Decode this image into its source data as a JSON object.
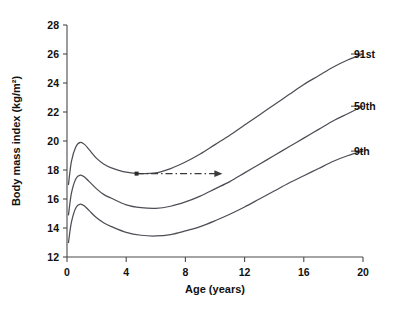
{
  "chart_data": {
    "type": "line",
    "title": "",
    "xlabel": "Age (years)",
    "ylabel": "Body mass index (kg/m²)",
    "xlim": [
      0,
      20
    ],
    "ylim": [
      12,
      28
    ],
    "xticks": [
      0,
      4,
      8,
      12,
      16,
      20
    ],
    "yticks": [
      12,
      14,
      16,
      18,
      20,
      22,
      24,
      26,
      28
    ],
    "xtick_labels": [
      "0",
      "4",
      "8",
      "12",
      "16",
      "20"
    ],
    "ytick_labels": [
      "12",
      "14",
      "16",
      "18",
      "20",
      "22",
      "24",
      "26",
      "28"
    ],
    "grid": false,
    "legend_position": "right-inline-labels",
    "series": [
      {
        "name": "91st",
        "label": "91st",
        "x": [
          0.1,
          0.3,
          0.6,
          0.9,
          1.2,
          1.5,
          2.0,
          2.5,
          3.0,
          4.0,
          5.0,
          6.0,
          7.0,
          8.0,
          9.0,
          10.0,
          11.0,
          12.0,
          13.0,
          14.0,
          15.0,
          16.0,
          17.0,
          18.0,
          19.0,
          20.0
        ],
        "y": [
          17.0,
          18.6,
          19.6,
          19.9,
          19.75,
          19.4,
          18.8,
          18.4,
          18.15,
          17.85,
          17.75,
          17.8,
          18.1,
          18.55,
          19.1,
          19.75,
          20.4,
          21.1,
          21.8,
          22.5,
          23.2,
          23.9,
          24.5,
          25.1,
          25.6,
          26.0
        ]
      },
      {
        "name": "50th",
        "label": "50th",
        "x": [
          0.1,
          0.3,
          0.6,
          0.9,
          1.2,
          1.5,
          2.0,
          2.5,
          3.0,
          4.0,
          5.0,
          6.0,
          7.0,
          8.0,
          9.0,
          10.0,
          11.0,
          12.0,
          13.0,
          14.0,
          15.0,
          16.0,
          17.0,
          18.0,
          19.0,
          20.0
        ],
        "y": [
          14.9,
          16.4,
          17.4,
          17.65,
          17.5,
          17.2,
          16.7,
          16.3,
          16.05,
          15.6,
          15.4,
          15.35,
          15.5,
          15.8,
          16.2,
          16.7,
          17.2,
          17.8,
          18.4,
          19.0,
          19.6,
          20.2,
          20.8,
          21.4,
          21.9,
          22.4
        ]
      },
      {
        "name": "9th",
        "label": "9th",
        "x": [
          0.1,
          0.3,
          0.6,
          0.9,
          1.2,
          1.5,
          2.0,
          2.5,
          3.0,
          4.0,
          5.0,
          6.0,
          7.0,
          8.0,
          9.0,
          10.0,
          11.0,
          12.0,
          13.0,
          14.0,
          15.0,
          16.0,
          17.0,
          18.0,
          19.0,
          20.0
        ],
        "y": [
          13.0,
          14.4,
          15.4,
          15.65,
          15.5,
          15.2,
          14.7,
          14.35,
          14.1,
          13.7,
          13.5,
          13.45,
          13.55,
          13.8,
          14.1,
          14.5,
          14.95,
          15.45,
          16.0,
          16.55,
          17.1,
          17.6,
          18.1,
          18.6,
          19.0,
          19.3
        ]
      }
    ],
    "annotations": [
      {
        "type": "arrow",
        "style": "dash-dot",
        "y": 17.75,
        "x_start": 4.7,
        "x_end": 10.5,
        "start_marker": "dot",
        "end_marker": "arrowhead",
        "label": ""
      }
    ]
  },
  "ghost_text": {
    "line": ""
  }
}
